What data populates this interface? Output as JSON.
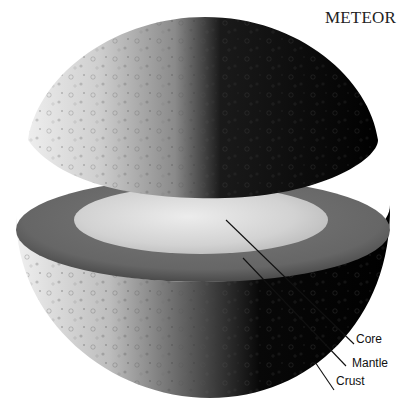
{
  "figure": {
    "title": "METEOR",
    "labels": [
      {
        "id": "core",
        "text": "Core"
      },
      {
        "id": "mantle",
        "text": "Mantle"
      },
      {
        "id": "crust",
        "text": "Crust"
      }
    ]
  },
  "colors": {
    "background": "#ffffff",
    "surface_light": "#d8d8d8",
    "surface_dark": "#050505",
    "mantle": "#6e6e6e",
    "core": "#d4d4d4",
    "leader_line": "#111111"
  }
}
